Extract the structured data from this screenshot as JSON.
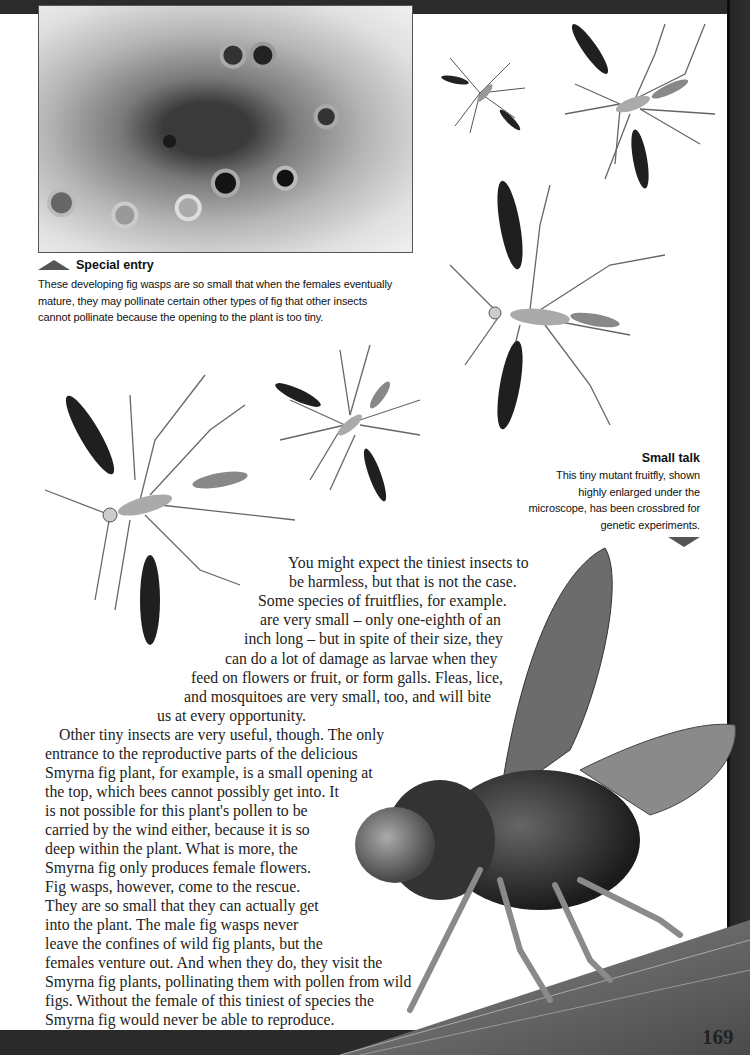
{
  "page": {
    "page_number": "169",
    "background_color": "#ffffff",
    "frame_color": "#2a2a2a"
  },
  "photo": {
    "subject": "developing fig wasps inside fig"
  },
  "captions": {
    "special_entry": {
      "title": "Special entry",
      "arrow": "triangle-up",
      "lines": [
        "These developing fig wasps are so small that when the females eventually",
        "mature, they may pollinate certain other types of fig that other insects",
        "cannot pollinate because the opening to the plant is too tiny."
      ]
    },
    "small_talk": {
      "title": "Small talk",
      "arrow": "triangle-down",
      "lines": [
        "This tiny mutant fruitfly, shown",
        "highly enlarged under the",
        "microscope, has been crossbred for",
        "genetic experiments."
      ]
    }
  },
  "body": {
    "paragraph1": [
      "You might expect the tiniest insects to",
      "be harmless, but that is not the case.",
      "Some species of fruitflies, for example.",
      "are very small – only one-eighth of an",
      "inch long – but in spite of their size, they",
      "can do a lot of damage as larvae when they",
      "feed on flowers or fruit, or form galls. Fleas, lice,",
      "and mosquitoes are very small, too, and will bite",
      "us at every opportunity."
    ],
    "paragraph2": [
      "Other tiny insects are very useful, though. The only",
      "entrance to the reproductive parts of the delicious",
      "Smyrna fig plant, for example, is a small opening at",
      "the top, which bees cannot possibly get into. It",
      "is not possible for this plant's pollen to be",
      "carried by the wind either, because it is so",
      "deep within the plant. What is more, the",
      "Smyrna fig only produces female flowers.",
      "Fig wasps, however, come to the rescue.",
      "They are so small that they can actually get",
      "into the plant. The male fig wasps never",
      "leave the confines of wild fig plants, but the",
      "females venture out. And when they do, they visit the",
      "Smyrna fig plants, pollinating them with pollen from wild",
      "figs. Without the female of this tiniest of species the",
      "Smyrna fig would never be able to reproduce."
    ]
  },
  "illustrations": [
    {
      "name": "fig-wasp-small-top",
      "type": "illustration"
    },
    {
      "name": "fig-wasp-top-right",
      "type": "illustration"
    },
    {
      "name": "fig-wasp-large-right",
      "type": "illustration"
    },
    {
      "name": "fig-wasp-center",
      "type": "illustration"
    },
    {
      "name": "fig-wasp-large-left",
      "type": "illustration"
    },
    {
      "name": "fruitfly-micrograph",
      "type": "photo"
    }
  ]
}
